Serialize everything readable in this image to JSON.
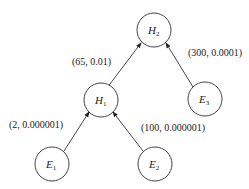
{
  "diagram": {
    "nodes": [
      {
        "id": "H2",
        "letter": "H",
        "sub": "2",
        "cx": 154,
        "cy": 30
      },
      {
        "id": "H1",
        "letter": "H",
        "sub": "1",
        "cx": 101,
        "cy": 100
      },
      {
        "id": "E3",
        "letter": "E",
        "sub": "3",
        "cx": 205,
        "cy": 99
      },
      {
        "id": "E1",
        "letter": "E",
        "sub": "1",
        "cx": 52,
        "cy": 164
      },
      {
        "id": "E2",
        "letter": "E",
        "sub": "2",
        "cx": 155,
        "cy": 164
      }
    ],
    "edges": [
      {
        "from": "H1",
        "to": "H2",
        "label": "(65, 0.01)"
      },
      {
        "from": "E3",
        "to": "H2",
        "label": "(300, 0.0001)"
      },
      {
        "from": "E1",
        "to": "H1",
        "label": "(2, 0.000001)"
      },
      {
        "from": "E2",
        "to": "H1",
        "label": "(100, 0.000001)"
      }
    ]
  }
}
